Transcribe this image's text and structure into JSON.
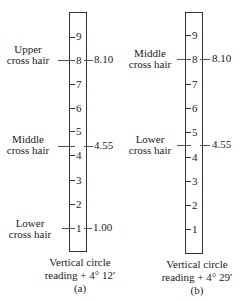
{
  "panels": [
    {
      "id": "a",
      "sublabel": "(a)",
      "caption_line1": "Vertical circle",
      "caption_line2": "reading + 4° 12′",
      "numbers": [
        "9",
        "8",
        "7",
        "6",
        "5",
        "4",
        "3",
        "2",
        "1"
      ],
      "hairs": [
        {
          "label1": "Upper",
          "label2": "cross hair",
          "value": "8.10"
        },
        {
          "label1": "Middle",
          "label2": "cross hair",
          "value": "4.55"
        },
        {
          "label1": "Lower",
          "label2": "cross hair",
          "value": "1.00"
        }
      ]
    },
    {
      "id": "b",
      "sublabel": "(b)",
      "caption_line1": "Vertical circle",
      "caption_line2": "reading + 4° 29′",
      "numbers": [
        "9",
        "8",
        "7",
        "6",
        "5",
        "4",
        "3",
        "2",
        "1"
      ],
      "hairs": [
        {
          "label1": "Middle",
          "label2": "cross hair",
          "value": "8.10"
        },
        {
          "label1": "Lower",
          "label2": "cross hair",
          "value": "4.55"
        }
      ]
    }
  ]
}
